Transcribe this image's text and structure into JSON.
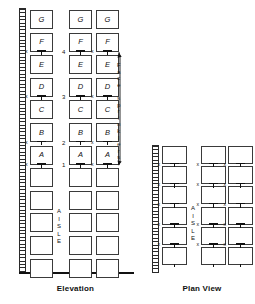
{
  "diagram": {
    "title_elevation": "Elevation",
    "title_plan": "Plan View",
    "aisle_label": "AISLE",
    "callout": "Face sprinklers",
    "tier_letters_bottom_to_top": [
      "A",
      "B",
      "C",
      "D",
      "E",
      "F",
      "G"
    ],
    "tier_numbers": [
      "1",
      "2",
      "3",
      "4"
    ],
    "x_mark": "x",
    "colors": {
      "line": "#3a3a3a",
      "ink": "#111111",
      "background": "#ffffff"
    }
  },
  "elevation": {
    "caption": "Elevation",
    "columns": [
      {
        "name": "left-rack-column",
        "labeled_boxes": [
          "G",
          "F",
          "E",
          "D",
          "C",
          "B",
          "A"
        ],
        "blank_boxes": 5
      },
      {
        "name": "right-rack-column-1",
        "labeled_boxes": [
          "G",
          "F",
          "E",
          "D",
          "C",
          "B",
          "A"
        ],
        "blank_boxes": 5
      },
      {
        "name": "right-rack-column-2",
        "labeled_boxes": [
          "G",
          "F",
          "E",
          "D",
          "C",
          "B",
          "A"
        ],
        "blank_boxes": 5
      }
    ],
    "tier_numbers": [
      "4",
      "3",
      "2",
      "1"
    ],
    "x_marks_count": 8,
    "aisle_label": "AISLE",
    "callout": "Face sprinklers",
    "wall_label": "hatched-wall"
  },
  "plan": {
    "caption": "Plan View",
    "columns": [
      {
        "name": "plan-left-column",
        "boxes": 6
      },
      {
        "name": "plan-right-column-1",
        "boxes": 6
      },
      {
        "name": "plan-right-column-2",
        "boxes": 6
      }
    ],
    "aisle_label": "AISLE",
    "x_marks_count": 10,
    "wall_label": "hatched-wall"
  }
}
